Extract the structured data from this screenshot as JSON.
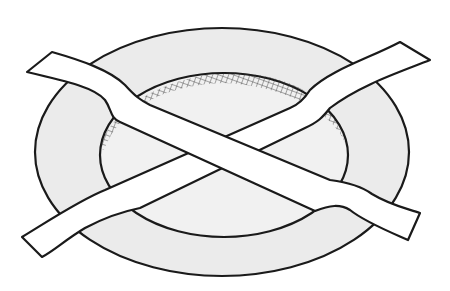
{
  "illustration": {
    "subject": "pan with two crossed strips",
    "colors": {
      "background": "#ffffff",
      "pan_fill": "#ebebeb",
      "inner_fill": "#f1f1f1",
      "strip_fill": "#ffffff",
      "stroke": "#1a1a1a"
    }
  }
}
